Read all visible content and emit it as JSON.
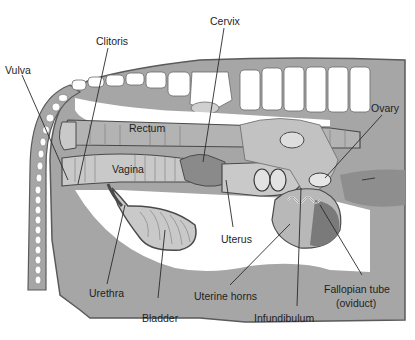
{
  "diagram": {
    "type": "anatomical cross-section",
    "colors": {
      "background": "#ffffff",
      "body_fill": "#a6a6a6",
      "body_outline": "#5a5a5a",
      "bone": "#ffffff",
      "organ_light": "#c9c9c9",
      "organ_mid": "#b3b3b3",
      "organ_dark": "#8a8a8a",
      "line": "#2a2a2a",
      "text": "#1e1e1e"
    },
    "labels": [
      {
        "id": "vulva",
        "text": "Vulva"
      },
      {
        "id": "clitoris",
        "text": "Clitoris"
      },
      {
        "id": "cervix",
        "text": "Cervix"
      },
      {
        "id": "ovary",
        "text": "Ovary"
      },
      {
        "id": "rectum",
        "text": "Rectum"
      },
      {
        "id": "vagina",
        "text": "Vagina"
      },
      {
        "id": "uterus",
        "text": "Uterus"
      },
      {
        "id": "urethra",
        "text": "Urethra"
      },
      {
        "id": "bladder",
        "text": "Bladder"
      },
      {
        "id": "uterine_horns",
        "text": "Uterine horns"
      },
      {
        "id": "infundibulum",
        "text": "Infundibulum"
      },
      {
        "id": "fallopian_tube_1",
        "text": "Fallopian tube"
      },
      {
        "id": "fallopian_tube_2",
        "text": "(oviduct)"
      }
    ]
  }
}
